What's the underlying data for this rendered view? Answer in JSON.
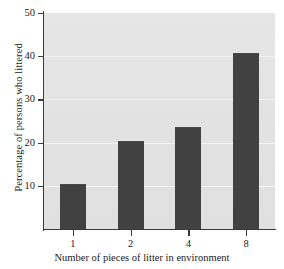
{
  "chart_data": {
    "type": "bar",
    "title": "",
    "subtitle": "",
    "xlabel": "Number of pieces of litter in environment",
    "ylabel": "Percentage of persons who littered",
    "categories": [
      "1",
      "2",
      "4",
      "8"
    ],
    "values": [
      10.5,
      20.4,
      23.7,
      40.8
    ],
    "ylim": [
      0,
      50
    ],
    "ytick_labels": [
      "10",
      "20",
      "30",
      "40",
      "50"
    ],
    "ytick_values": [
      10,
      20,
      30,
      40,
      50
    ],
    "xtick_labels": [
      "1",
      "2",
      "4",
      "8"
    ],
    "grid": true,
    "grid_axis": "y",
    "legend": false,
    "legend_position": "none",
    "annotations": [],
    "colors": {
      "bar": "#414141",
      "plot_background": "#e4e4e4",
      "gridline": "#f3f3f3",
      "axis": "#3a3a3a",
      "text": "#1a1a1a",
      "figure_background": "#ffffff"
    }
  }
}
